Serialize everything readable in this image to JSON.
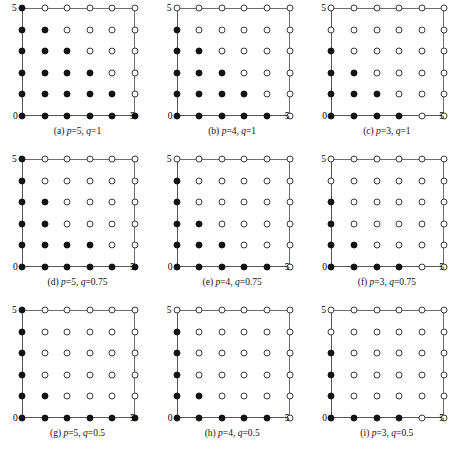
{
  "figure": {
    "layout": {
      "rows": 3,
      "cols": 3
    },
    "axis": {
      "min_label": "0",
      "max_label": "5"
    }
  },
  "chart_data": {
    "type": "scatter",
    "title": "",
    "xlabel": "",
    "ylabel": "",
    "xlim": [
      0,
      5
    ],
    "ylim": [
      0,
      5
    ],
    "xticks": [
      0,
      5
    ],
    "yticks": [
      0,
      5
    ],
    "grid": false,
    "legend": null,
    "marker_types": [
      "filled",
      "open"
    ],
    "lattice": {
      "x": [
        0,
        1,
        2,
        3,
        4,
        5
      ],
      "y": [
        0,
        1,
        2,
        3,
        4,
        5
      ]
    },
    "panels": [
      {
        "id": "a",
        "caption_prefix": "(a)",
        "p": 5,
        "q": 1,
        "caption": "(a) p=5, q=1",
        "filled_counts_by_row_top_to_bottom": [
          1,
          2,
          3,
          4,
          5,
          6
        ],
        "points": [
          {
            "y": 5,
            "filled_x": [
              0
            ],
            "open_x": [
              1,
              2,
              3,
              4,
              5
            ]
          },
          {
            "y": 4,
            "filled_x": [
              0,
              1
            ],
            "open_x": [
              2,
              3,
              4,
              5
            ]
          },
          {
            "y": 3,
            "filled_x": [
              0,
              1,
              2
            ],
            "open_x": [
              3,
              4,
              5
            ]
          },
          {
            "y": 2,
            "filled_x": [
              0,
              1,
              2,
              3
            ],
            "open_x": [
              4,
              5
            ]
          },
          {
            "y": 1,
            "filled_x": [
              0,
              1,
              2,
              3,
              4
            ],
            "open_x": [
              5
            ]
          },
          {
            "y": 0,
            "filled_x": [
              0,
              1,
              2,
              3,
              4,
              5
            ],
            "open_x": []
          }
        ]
      },
      {
        "id": "b",
        "caption_prefix": "(b)",
        "p": 4,
        "q": 1,
        "caption": "(b) p=4, q=1",
        "filled_counts_by_row_top_to_bottom": [
          0,
          1,
          2,
          3,
          4,
          5
        ],
        "points": [
          {
            "y": 5,
            "filled_x": [],
            "open_x": [
              0,
              1,
              2,
              3,
              4,
              5
            ]
          },
          {
            "y": 4,
            "filled_x": [
              0
            ],
            "open_x": [
              1,
              2,
              3,
              4,
              5
            ]
          },
          {
            "y": 3,
            "filled_x": [
              0,
              1
            ],
            "open_x": [
              2,
              3,
              4,
              5
            ]
          },
          {
            "y": 2,
            "filled_x": [
              0,
              1,
              2
            ],
            "open_x": [
              3,
              4,
              5
            ]
          },
          {
            "y": 1,
            "filled_x": [
              0,
              1,
              2,
              3
            ],
            "open_x": [
              4,
              5
            ]
          },
          {
            "y": 0,
            "filled_x": [
              0,
              1,
              2,
              3,
              4
            ],
            "open_x": [
              5
            ]
          }
        ]
      },
      {
        "id": "c",
        "caption_prefix": "(c)",
        "p": 3,
        "q": 1,
        "caption": "(c) p=3, q=1",
        "filled_counts_by_row_top_to_bottom": [
          0,
          0,
          1,
          2,
          3,
          4
        ],
        "points": [
          {
            "y": 5,
            "filled_x": [],
            "open_x": [
              0,
              1,
              2,
              3,
              4,
              5
            ]
          },
          {
            "y": 4,
            "filled_x": [],
            "open_x": [
              0,
              1,
              2,
              3,
              4,
              5
            ]
          },
          {
            "y": 3,
            "filled_x": [
              0
            ],
            "open_x": [
              1,
              2,
              3,
              4,
              5
            ]
          },
          {
            "y": 2,
            "filled_x": [
              0,
              1
            ],
            "open_x": [
              2,
              3,
              4,
              5
            ]
          },
          {
            "y": 1,
            "filled_x": [
              0,
              1,
              2
            ],
            "open_x": [
              3,
              4,
              5
            ]
          },
          {
            "y": 0,
            "filled_x": [
              0,
              1,
              2,
              3
            ],
            "open_x": [
              4,
              5
            ]
          }
        ]
      },
      {
        "id": "d",
        "caption_prefix": "(d)",
        "p": 5,
        "q": 0.75,
        "caption": "(d) p=5, q=0.75",
        "filled_counts_by_row_top_to_bottom": [
          1,
          1,
          2,
          2,
          4,
          6
        ],
        "points": [
          {
            "y": 5,
            "filled_x": [
              0
            ],
            "open_x": [
              1,
              2,
              3,
              4,
              5
            ]
          },
          {
            "y": 4,
            "filled_x": [
              0
            ],
            "open_x": [
              1,
              2,
              3,
              4,
              5
            ]
          },
          {
            "y": 3,
            "filled_x": [
              0,
              1
            ],
            "open_x": [
              2,
              3,
              4,
              5
            ]
          },
          {
            "y": 2,
            "filled_x": [
              0,
              1
            ],
            "open_x": [
              2,
              3,
              4,
              5
            ]
          },
          {
            "y": 1,
            "filled_x": [
              0,
              1,
              2,
              3
            ],
            "open_x": [
              4,
              5
            ]
          },
          {
            "y": 0,
            "filled_x": [
              0,
              1,
              2,
              3,
              4,
              5
            ],
            "open_x": []
          }
        ]
      },
      {
        "id": "e",
        "caption_prefix": "(e)",
        "p": 4,
        "q": 0.75,
        "caption": "(e) p=4, q=0.75",
        "filled_counts_by_row_top_to_bottom": [
          0,
          1,
          1,
          2,
          3,
          5
        ],
        "points": [
          {
            "y": 5,
            "filled_x": [],
            "open_x": [
              0,
              1,
              2,
              3,
              4,
              5
            ]
          },
          {
            "y": 4,
            "filled_x": [
              0
            ],
            "open_x": [
              1,
              2,
              3,
              4,
              5
            ]
          },
          {
            "y": 3,
            "filled_x": [
              0
            ],
            "open_x": [
              1,
              2,
              3,
              4,
              5
            ]
          },
          {
            "y": 2,
            "filled_x": [
              0,
              1
            ],
            "open_x": [
              2,
              3,
              4,
              5
            ]
          },
          {
            "y": 1,
            "filled_x": [
              0,
              1,
              2
            ],
            "open_x": [
              3,
              4,
              5
            ]
          },
          {
            "y": 0,
            "filled_x": [
              0,
              1,
              2,
              3,
              4
            ],
            "open_x": [
              5
            ]
          }
        ]
      },
      {
        "id": "f",
        "caption_prefix": "(f)",
        "p": 3,
        "q": 0.75,
        "caption": "(f) p=3, q=0.75",
        "filled_counts_by_row_top_to_bottom": [
          0,
          0,
          1,
          1,
          2,
          4
        ],
        "points": [
          {
            "y": 5,
            "filled_x": [],
            "open_x": [
              0,
              1,
              2,
              3,
              4,
              5
            ]
          },
          {
            "y": 4,
            "filled_x": [],
            "open_x": [
              0,
              1,
              2,
              3,
              4,
              5
            ]
          },
          {
            "y": 3,
            "filled_x": [
              0
            ],
            "open_x": [
              1,
              2,
              3,
              4,
              5
            ]
          },
          {
            "y": 2,
            "filled_x": [
              0
            ],
            "open_x": [
              1,
              2,
              3,
              4,
              5
            ]
          },
          {
            "y": 1,
            "filled_x": [
              0,
              1
            ],
            "open_x": [
              2,
              3,
              4,
              5
            ]
          },
          {
            "y": 0,
            "filled_x": [
              0,
              1,
              2,
              3
            ],
            "open_x": [
              4,
              5
            ]
          }
        ]
      },
      {
        "id": "g",
        "caption_prefix": "(g)",
        "p": 5,
        "q": 0.5,
        "caption": "(g) p=5, q=0.5",
        "filled_counts_by_row_top_to_bottom": [
          1,
          1,
          1,
          1,
          2,
          6
        ],
        "points": [
          {
            "y": 5,
            "filled_x": [
              0
            ],
            "open_x": [
              1,
              2,
              3,
              4,
              5
            ]
          },
          {
            "y": 4,
            "filled_x": [
              0
            ],
            "open_x": [
              1,
              2,
              3,
              4,
              5
            ]
          },
          {
            "y": 3,
            "filled_x": [
              0
            ],
            "open_x": [
              1,
              2,
              3,
              4,
              5
            ]
          },
          {
            "y": 2,
            "filled_x": [
              0
            ],
            "open_x": [
              1,
              2,
              3,
              4,
              5
            ]
          },
          {
            "y": 1,
            "filled_x": [
              0,
              1
            ],
            "open_x": [
              2,
              3,
              4,
              5
            ]
          },
          {
            "y": 0,
            "filled_x": [
              0,
              1,
              2,
              3,
              4,
              5
            ],
            "open_x": []
          }
        ]
      },
      {
        "id": "h",
        "caption_prefix": "(h)",
        "p": 4,
        "q": 0.5,
        "caption": "(h) p=4, q=0.5",
        "filled_counts_by_row_top_to_bottom": [
          0,
          1,
          1,
          1,
          2,
          5
        ],
        "points": [
          {
            "y": 5,
            "filled_x": [],
            "open_x": [
              0,
              1,
              2,
              3,
              4,
              5
            ]
          },
          {
            "y": 4,
            "filled_x": [
              0
            ],
            "open_x": [
              1,
              2,
              3,
              4,
              5
            ]
          },
          {
            "y": 3,
            "filled_x": [
              0
            ],
            "open_x": [
              1,
              2,
              3,
              4,
              5
            ]
          },
          {
            "y": 2,
            "filled_x": [
              0
            ],
            "open_x": [
              1,
              2,
              3,
              4,
              5
            ]
          },
          {
            "y": 1,
            "filled_x": [
              0,
              1
            ],
            "open_x": [
              2,
              3,
              4,
              5
            ]
          },
          {
            "y": 0,
            "filled_x": [
              0,
              1,
              2,
              3,
              4
            ],
            "open_x": [
              5
            ]
          }
        ]
      },
      {
        "id": "i",
        "caption_prefix": "(i)",
        "p": 3,
        "q": 0.5,
        "caption": "(i) p=3, q=0.5",
        "filled_counts_by_row_top_to_bottom": [
          0,
          0,
          1,
          1,
          1,
          4
        ],
        "points": [
          {
            "y": 5,
            "filled_x": [],
            "open_x": [
              0,
              1,
              2,
              3,
              4,
              5
            ]
          },
          {
            "y": 4,
            "filled_x": [],
            "open_x": [
              0,
              1,
              2,
              3,
              4,
              5
            ]
          },
          {
            "y": 3,
            "filled_x": [
              0
            ],
            "open_x": [
              1,
              2,
              3,
              4,
              5
            ]
          },
          {
            "y": 2,
            "filled_x": [
              0
            ],
            "open_x": [
              1,
              2,
              3,
              4,
              5
            ]
          },
          {
            "y": 1,
            "filled_x": [
              0
            ],
            "open_x": [
              1,
              2,
              3,
              4,
              5
            ]
          },
          {
            "y": 0,
            "filled_x": [
              0,
              1,
              2,
              3
            ],
            "open_x": [
              4,
              5
            ]
          }
        ]
      }
    ]
  }
}
